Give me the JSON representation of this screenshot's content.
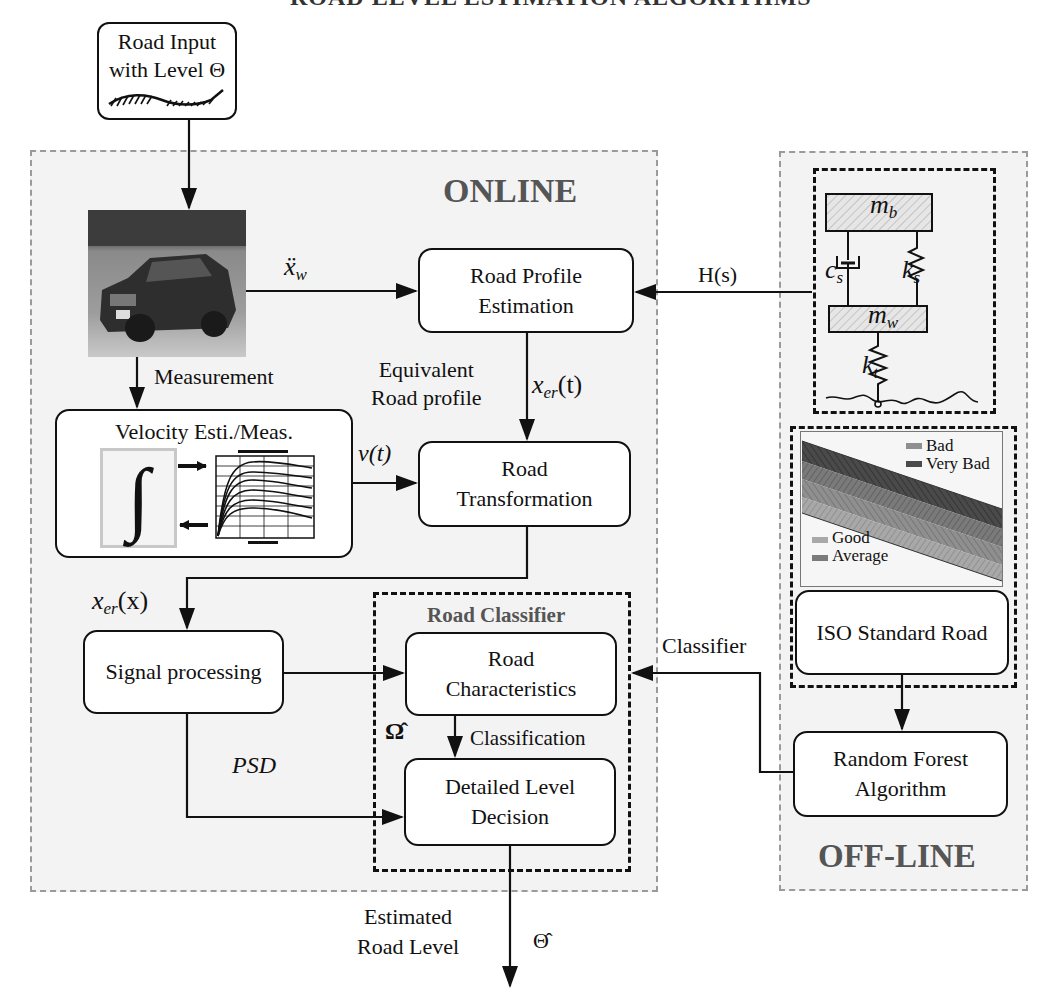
{
  "header": {
    "title_fragment": "ROAD LEVEL ESTIMATION ALGORITHMS"
  },
  "input": {
    "line1": "Road Input",
    "line2": "with Level",
    "symbol": "Θ"
  },
  "online": {
    "title": "ONLINE",
    "vehicle_photo": "vehicle-photo",
    "signals": {
      "xw": "ẍ",
      "xw_sub": "w",
      "measurement": "Measurement",
      "equivalent_line1": "Equivalent",
      "equivalent_line2": "Road profile",
      "xer_t": "x",
      "xer_t_sub": "er",
      "xer_t_arg": "(t)",
      "vt": "v(t)",
      "xer_x": "x",
      "xer_x_sub": "er",
      "xer_x_arg": "(x)",
      "psd": "PSD",
      "omega_hat": "Ω̂",
      "classification": "Classification"
    },
    "boxes": {
      "road_profile": {
        "line1": "Road Profile",
        "line2": "Estimation"
      },
      "velocity": {
        "title": "Velocity Esti./Meas.",
        "integral": "∫"
      },
      "road_transformation": {
        "line1": "Road",
        "line2": "Transformation"
      },
      "signal_processing": {
        "line1": "Signal processing"
      },
      "road_characteristics": {
        "line1": "Road",
        "line2": "Characteristics"
      },
      "detailed_level": {
        "line1": "Detailed Level",
        "line2": "Decision"
      }
    },
    "classifier_group": {
      "title": "Road Classifier"
    }
  },
  "offline": {
    "title": "OFF-LINE",
    "hs_label": "H(s)",
    "classifier_label": "Classifier",
    "quarter_car": {
      "mb": "m",
      "mb_sub": "b",
      "mw": "m",
      "mw_sub": "w",
      "cs": "c",
      "cs_sub": "s",
      "ks": "k",
      "ks_sub": "s",
      "kt": "k",
      "kt_sub": "t"
    },
    "iso_chart_legend": [
      "Bad",
      "Very Bad",
      "Good",
      "Average"
    ],
    "boxes": {
      "iso_standard": {
        "line1": "ISO Standard Road"
      },
      "random_forest": {
        "line1": "Random Forest",
        "line2": "Algorithm"
      }
    }
  },
  "output": {
    "line1": "Estimated",
    "line2": "Road Level",
    "symbol": "Θ̂"
  },
  "colors": {
    "panel_bg": "#f3f3f3",
    "panel_border": "#9a9a9a",
    "panel_title": "#555555",
    "stroke": "#111111"
  }
}
